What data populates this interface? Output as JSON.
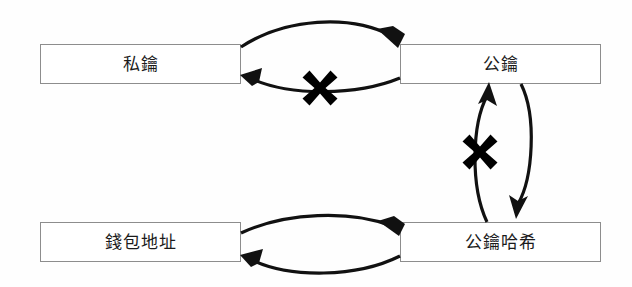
{
  "diagram": {
    "title": "",
    "background_color": "#fefefe",
    "box_border_color": "#8d8d8d",
    "stroke_color": "#111111",
    "cross_color": "#000000",
    "nodes": [
      {
        "id": "private-key",
        "label": "私鑰",
        "x": 40,
        "y": 44,
        "w": 201,
        "h": 40
      },
      {
        "id": "public-key",
        "label": "公鑰",
        "x": 400,
        "y": 44,
        "w": 201,
        "h": 40
      },
      {
        "id": "wallet-address",
        "label": "錢包地址",
        "x": 40,
        "y": 222,
        "w": 201,
        "h": 40
      },
      {
        "id": "public-key-hash",
        "label": "公鑰哈希",
        "x": 400,
        "y": 222,
        "w": 201,
        "h": 40
      }
    ],
    "edges": [
      {
        "id": "private-to-public",
        "from": "private-key",
        "to": "public-key",
        "direction": "right",
        "blocked": false
      },
      {
        "id": "public-to-private",
        "from": "public-key",
        "to": "private-key",
        "direction": "left",
        "blocked": true
      },
      {
        "id": "public-hash-to-public",
        "from": "public-key-hash",
        "to": "public-key",
        "direction": "up",
        "blocked": true
      },
      {
        "id": "public-to-public-hash",
        "from": "public-key",
        "to": "public-key-hash",
        "direction": "down",
        "blocked": false
      },
      {
        "id": "wallet-to-hash",
        "from": "wallet-address",
        "to": "public-key-hash",
        "direction": "right",
        "blocked": false
      },
      {
        "id": "hash-to-wallet",
        "from": "public-key-hash",
        "to": "wallet-address",
        "direction": "left",
        "blocked": false
      }
    ],
    "cross_marks": [
      {
        "id": "cross-top",
        "on_edge": "public-to-private",
        "cx": 320,
        "cy": 88,
        "size": 44,
        "icon": "cross-x-icon"
      },
      {
        "id": "cross-middle",
        "on_edge": "public-hash-to-public",
        "cx": 480,
        "cy": 152,
        "size": 44,
        "icon": "cross-x-icon"
      }
    ]
  }
}
